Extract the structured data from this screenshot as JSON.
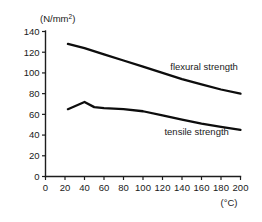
{
  "chart_data": {
    "type": "line",
    "title": "",
    "xlabel": "(°C)",
    "ylabel": "(N/mm²)",
    "ylabel_main": "(N/mm",
    "ylabel_sup": "2",
    "ylabel_tail": ")",
    "xlim": [
      0,
      200
    ],
    "ylim": [
      0,
      140
    ],
    "grid": false,
    "legend_position": "inline-annotation",
    "xticks": [
      0,
      20,
      40,
      60,
      80,
      100,
      120,
      140,
      160,
      180,
      200
    ],
    "yticks": [
      0,
      20,
      40,
      60,
      80,
      100,
      120,
      140
    ],
    "xtick_labels": [
      "0",
      "20",
      "40",
      "60",
      "80",
      "100",
      "120",
      "140",
      "160",
      "180",
      "200"
    ],
    "ytick_labels": [
      "0",
      "20",
      "40",
      "60",
      "80",
      "100",
      "120",
      "140"
    ],
    "series": [
      {
        "name": "flexural strength",
        "label": "flexural strength",
        "color": "#0d0d0d",
        "x": [
          23,
          40,
          60,
          80,
          100,
          120,
          140,
          160,
          180,
          200
        ],
        "values": [
          128,
          124,
          118,
          112,
          106,
          100,
          94,
          89,
          84,
          80
        ]
      },
      {
        "name": "tensile strength",
        "label": "tensile strength",
        "color": "#0d0d0d",
        "x": [
          23,
          40,
          50,
          60,
          80,
          100,
          120,
          140,
          160,
          180,
          200
        ],
        "values": [
          65,
          72,
          67,
          66,
          65,
          63,
          59,
          55,
          51,
          48,
          45
        ]
      }
    ],
    "annotations": [
      {
        "text": "flexural strength",
        "x": 128,
        "y": 103
      },
      {
        "text": "tensile strength",
        "x": 122,
        "y": 40
      }
    ]
  }
}
